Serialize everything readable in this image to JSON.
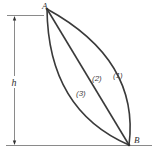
{
  "diagram": {
    "title": "",
    "points": {
      "start": {
        "label": "A"
      },
      "end": {
        "label": "B"
      }
    },
    "dimension": {
      "label": "h"
    },
    "paths": [
      {
        "label": "(1)",
        "shape": "curve-convex-right"
      },
      {
        "label": "(2)",
        "shape": "straight-line"
      },
      {
        "label": "(3)",
        "shape": "curve-convex-left"
      }
    ],
    "colors": {
      "path_stroke": "#3a3a3a",
      "guide_stroke": "#8a8a8a",
      "text": "#333333"
    }
  }
}
